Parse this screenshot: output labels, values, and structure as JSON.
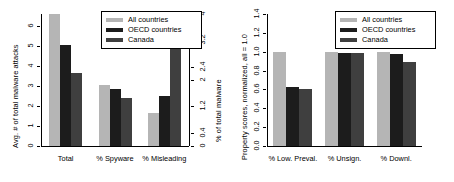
{
  "figure": {
    "background": "#ffffff",
    "series_colors": {
      "all_countries": "#b5b5b5",
      "oecd_countries": "#1c1c1c",
      "canada": "#3f3f3f"
    }
  },
  "legend": {
    "position": "top-right",
    "entries": [
      {
        "label": "All countries",
        "color": "#b5b5b5"
      },
      {
        "label": "OECD countries",
        "color": "#1c1c1c"
      },
      {
        "label": "Canada",
        "color": "#3f3f3f"
      }
    ]
  },
  "chart_data": [
    {
      "type": "bar",
      "id": "left-panel",
      "title": "",
      "xlabel": "",
      "ylabel": "Avg. # of total malware attacks",
      "y2label": "% of total malware",
      "ylim": [
        0,
        6.6
      ],
      "y2lim": [
        0,
        4
      ],
      "yticks": [
        "0",
        "1",
        "2",
        "3",
        "4",
        "5",
        "6"
      ],
      "ytick_values": [
        0,
        1,
        2,
        3,
        4,
        5,
        6
      ],
      "y2ticks": [
        "0",
        "0.4",
        "1.2",
        "2",
        "2.4",
        "3.2",
        "4"
      ],
      "y2tick_values": [
        0,
        0.4,
        1.2,
        2,
        2.4,
        3.2,
        4
      ],
      "grid": false,
      "categories": [
        "Total",
        "% Spyware",
        "% Misleading"
      ],
      "series": [
        {
          "name": "All countries",
          "color": "#b5b5b5",
          "values": [
            6.6,
            1.85,
            1.0
          ]
        },
        {
          "name": "OECD countries",
          "color": "#1c1c1c",
          "values": [
            5.05,
            1.73,
            1.52
          ]
        },
        {
          "name": "Canada",
          "color": "#3f3f3f",
          "values": [
            3.65,
            1.47,
            3.25
          ]
        }
      ],
      "notes": "Total group read on left axis; % Spyware and % Misleading read on right axis (% of total malware)."
    },
    {
      "type": "bar",
      "id": "right-panel",
      "title": "",
      "xlabel": "",
      "ylabel": "Property scores, normalized, all = 1.0",
      "ylim": [
        0,
        1.4
      ],
      "yticks": [
        "0.0",
        "0.2",
        "0.4",
        "0.6",
        "0.8",
        "1.0",
        "1.2",
        "1.4"
      ],
      "ytick_values": [
        0.0,
        0.2,
        0.4,
        0.6,
        0.8,
        1.0,
        1.2,
        1.4
      ],
      "grid": false,
      "categories": [
        "% Low. Preval.",
        "% Unsign.",
        "% Downl."
      ],
      "series": [
        {
          "name": "All countries",
          "color": "#b5b5b5",
          "values": [
            1.0,
            1.0,
            1.0
          ]
        },
        {
          "name": "OECD countries",
          "color": "#1c1c1c",
          "values": [
            0.63,
            0.99,
            0.98
          ]
        },
        {
          "name": "Canada",
          "color": "#3f3f3f",
          "values": [
            0.6,
            0.99,
            0.89
          ]
        }
      ]
    }
  ]
}
